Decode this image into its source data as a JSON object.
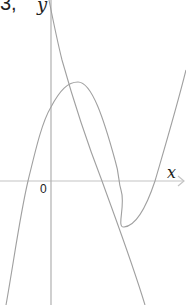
{
  "top_text": "3,",
  "axes": {
    "x_label": "x",
    "y_label": "y",
    "origin_label": "0",
    "axis_color": "#b8b8b8",
    "curve_color": "#999999"
  },
  "curves": [
    {
      "name": "cubic-curve",
      "description": "rises, local max, local min, rises again"
    },
    {
      "name": "descending-curve",
      "description": "steeply decreasing curve crossing y-axis near top"
    }
  ]
}
